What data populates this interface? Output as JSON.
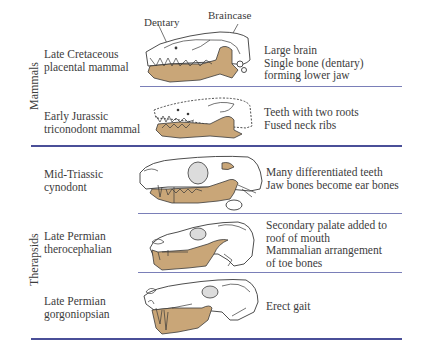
{
  "groups": [
    {
      "label": "Mammals"
    },
    {
      "label": "Therapsids"
    }
  ],
  "callouts": {
    "dentary": "Dentary",
    "braincase": "Braincase"
  },
  "rows": [
    {
      "name_lines": [
        "Late Cretaceous",
        "placental mammal"
      ],
      "traits": [
        "Large brain",
        "Single bone (dentary)",
        "forming lower jaw"
      ]
    },
    {
      "name_lines": [
        "Early Jurassic",
        "triconodont mammal"
      ],
      "traits": [
        "Teeth with two roots",
        "Fused neck ribs"
      ]
    },
    {
      "name_lines": [
        "Mid-Triassic",
        "cynodont"
      ],
      "traits": [
        "Many differentiated teeth",
        "Jaw bones become ear bones"
      ]
    },
    {
      "name_lines": [
        "Late Permian",
        "therocephalian"
      ],
      "traits": [
        "Secondary palate added to",
        "roof of mouth",
        "Mammalian arrangement",
        "of toe bones"
      ]
    },
    {
      "name_lines": [
        "Late Permian",
        "gorgoniopsian"
      ],
      "traits": [
        "Erect gait"
      ]
    }
  ],
  "colors": {
    "dentary_bone": "#c9a678",
    "rule": "#4a4f98",
    "text": "#3c3c3c"
  }
}
